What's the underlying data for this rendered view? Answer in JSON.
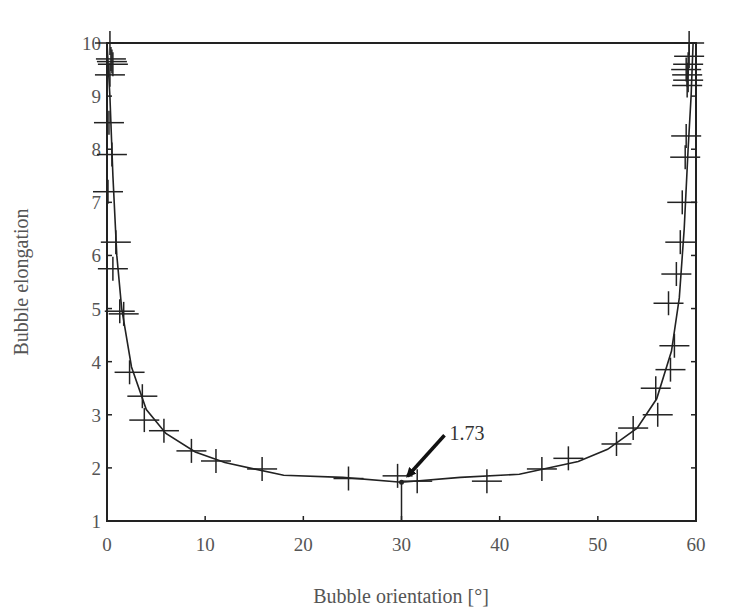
{
  "chart_data": {
    "type": "scatter",
    "title": "",
    "xlabel": "Bubble orientation [°]",
    "ylabel": "Bubble elongation",
    "xlim": [
      0,
      60
    ],
    "ylim": [
      1,
      10
    ],
    "xticks": [
      0,
      10,
      20,
      30,
      40,
      50,
      60
    ],
    "yticks": [
      1,
      2,
      3,
      4,
      5,
      6,
      7,
      8,
      9,
      10
    ],
    "grid": false,
    "legend": null,
    "series": [
      {
        "name": "measured",
        "marker": "plus",
        "points": [
          [
            0.3,
            10.0
          ],
          [
            0.4,
            9.7
          ],
          [
            0.5,
            9.65
          ],
          [
            0.6,
            9.6
          ],
          [
            0.3,
            9.4
          ],
          [
            0.2,
            8.5
          ],
          [
            0.5,
            7.9
          ],
          [
            0.1,
            7.2
          ],
          [
            0.9,
            6.25
          ],
          [
            0.6,
            5.75
          ],
          [
            1.3,
            4.95
          ],
          [
            1.7,
            4.9
          ],
          [
            2.3,
            3.8
          ],
          [
            3.6,
            3.35
          ],
          [
            3.8,
            2.9
          ],
          [
            5.8,
            2.7
          ],
          [
            8.6,
            2.32
          ],
          [
            11.1,
            2.13
          ],
          [
            15.8,
            1.98
          ],
          [
            24.6,
            1.8
          ],
          [
            29.6,
            1.85
          ],
          [
            31.6,
            1.75
          ],
          [
            38.7,
            1.75
          ],
          [
            44.3,
            1.98
          ],
          [
            47.0,
            2.18
          ],
          [
            51.9,
            2.45
          ],
          [
            53.6,
            2.75
          ],
          [
            56.1,
            3.0
          ],
          [
            55.9,
            3.5
          ],
          [
            57.4,
            3.85
          ],
          [
            57.8,
            4.3
          ],
          [
            57.2,
            5.1
          ],
          [
            58.0,
            5.65
          ],
          [
            58.4,
            6.25
          ],
          [
            58.6,
            7.0
          ],
          [
            58.9,
            7.85
          ],
          [
            59.0,
            8.25
          ],
          [
            59.1,
            9.2
          ],
          [
            59.2,
            9.3
          ],
          [
            59.1,
            9.4
          ],
          [
            59.0,
            9.5
          ],
          [
            59.2,
            9.6
          ],
          [
            59.3,
            9.75
          ],
          [
            59.3,
            10.0
          ]
        ]
      },
      {
        "name": "theory",
        "line": "solid",
        "points": [
          [
            0.0,
            10.0
          ],
          [
            0.3,
            9.0
          ],
          [
            0.6,
            7.5
          ],
          [
            1.0,
            6.0
          ],
          [
            1.5,
            5.0
          ],
          [
            2.5,
            3.9
          ],
          [
            4.0,
            3.1
          ],
          [
            6.0,
            2.65
          ],
          [
            9.0,
            2.3
          ],
          [
            12.0,
            2.1
          ],
          [
            18.0,
            1.86
          ],
          [
            24.0,
            1.82
          ],
          [
            30.0,
            1.73
          ],
          [
            36.0,
            1.82
          ],
          [
            42.0,
            1.88
          ],
          [
            48.0,
            2.12
          ],
          [
            51.0,
            2.35
          ],
          [
            54.0,
            2.75
          ],
          [
            56.0,
            3.3
          ],
          [
            57.5,
            4.2
          ],
          [
            58.3,
            5.2
          ],
          [
            58.8,
            6.5
          ],
          [
            59.2,
            8.0
          ],
          [
            59.5,
            9.0
          ],
          [
            59.7,
            10.0
          ]
        ]
      }
    ],
    "annotations": [
      {
        "text": "1.73",
        "x": 30,
        "y": 1.73,
        "arrow": true,
        "dropline": true
      }
    ]
  },
  "labels": {
    "xlabel": "Bubble orientation [°]",
    "ylabel": "Bubble elongation",
    "annotation": "1.73"
  }
}
